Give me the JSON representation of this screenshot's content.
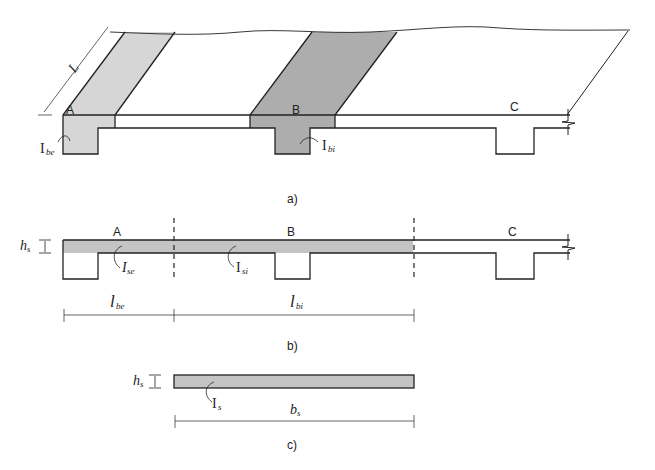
{
  "figure": {
    "panels": [
      {
        "id": "a",
        "caption": "a)"
      },
      {
        "id": "b",
        "caption": "b)"
      },
      {
        "id": "c",
        "caption": "c)"
      }
    ],
    "panel_a": {
      "beam_labels": [
        "A",
        "B",
        "C"
      ],
      "length_label": "L",
      "inertia_edge": {
        "main": "I",
        "sub": "be"
      },
      "inertia_interior": {
        "main": "I",
        "sub": "bi"
      }
    },
    "panel_b": {
      "beam_labels": [
        "A",
        "B",
        "C"
      ],
      "slab_thickness": {
        "main": "h",
        "sub": "s"
      },
      "inertia_edge": {
        "main": "I",
        "sub": "se"
      },
      "inertia_interior": {
        "main": "I",
        "sub": "si"
      },
      "width_edge": {
        "main": "l",
        "sub": "be"
      },
      "width_interior": {
        "main": "l",
        "sub": "bi"
      }
    },
    "panel_c": {
      "slab_thickness": {
        "main": "h",
        "sub": "s"
      },
      "inertia": {
        "main": "I",
        "sub": "s"
      },
      "width": {
        "main": "b",
        "sub": "s"
      }
    },
    "colors": {
      "light_fill": "#d6d6d6",
      "dark_fill": "#adadad",
      "strip_fill": "#c4c4c4",
      "stroke": "#222222"
    }
  }
}
